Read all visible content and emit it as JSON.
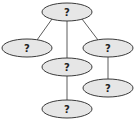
{
  "diagram": {
    "type": "tree",
    "nodes": [
      {
        "id": "root",
        "label": "?"
      },
      {
        "id": "left",
        "label": "?"
      },
      {
        "id": "middle",
        "label": "?"
      },
      {
        "id": "right",
        "label": "?"
      },
      {
        "id": "right_child",
        "label": "?"
      },
      {
        "id": "middle_child",
        "label": "?"
      }
    ],
    "edges": [
      {
        "from": "root",
        "to": "left"
      },
      {
        "from": "root",
        "to": "middle"
      },
      {
        "from": "root",
        "to": "right"
      },
      {
        "from": "right",
        "to": "right_child"
      },
      {
        "from": "middle",
        "to": "middle_child"
      }
    ]
  },
  "colors": {
    "node_fill": "#e6e6e6",
    "node_stroke": "#3a3a3a",
    "edge": "#4a4a4a"
  }
}
